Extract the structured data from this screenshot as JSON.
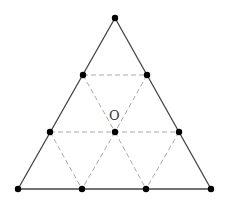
{
  "diagram": {
    "center_label": "O",
    "outer_triangle": [
      [
        115,
        18
      ],
      [
        18,
        189
      ],
      [
        211,
        189
      ]
    ],
    "points": [
      {
        "id": "top",
        "x": 115,
        "y": 18
      },
      {
        "id": "upper-left",
        "x": 83,
        "y": 75
      },
      {
        "id": "upper-right",
        "x": 147,
        "y": 75
      },
      {
        "id": "mid-left",
        "x": 50,
        "y": 132
      },
      {
        "id": "center",
        "x": 115,
        "y": 132
      },
      {
        "id": "mid-right",
        "x": 179,
        "y": 132
      },
      {
        "id": "bottom-1",
        "x": 18,
        "y": 189
      },
      {
        "id": "bottom-2",
        "x": 82,
        "y": 189
      },
      {
        "id": "bottom-3",
        "x": 146,
        "y": 189
      },
      {
        "id": "bottom-4",
        "x": 211,
        "y": 189
      }
    ],
    "colors": {
      "solid": "#444444",
      "dashed": "#aaaaaa",
      "point": "#000000"
    }
  }
}
